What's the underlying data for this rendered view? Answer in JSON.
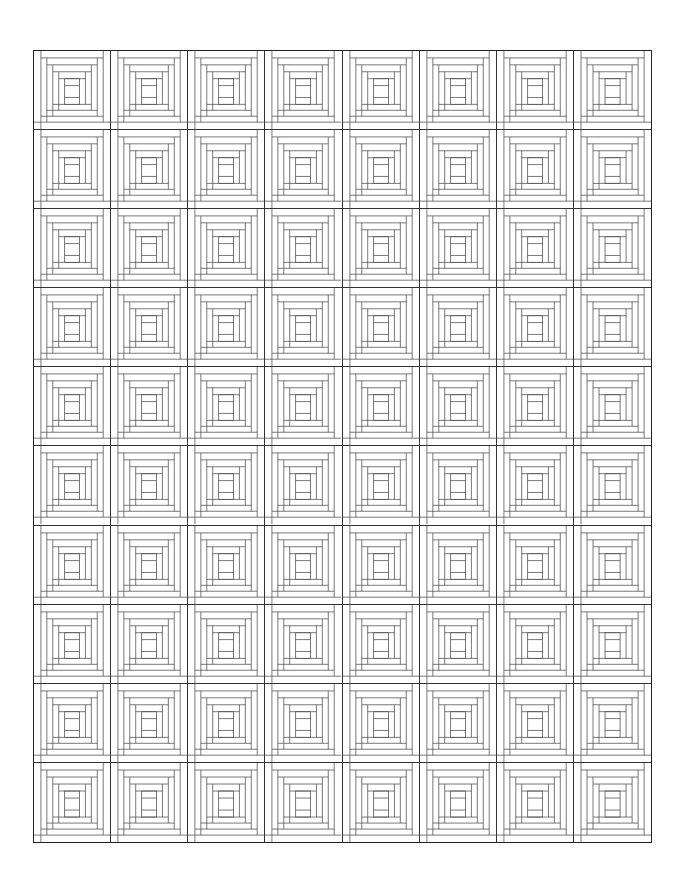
{
  "pattern": {
    "type": "log-cabin-quilt-outline",
    "columns": 8,
    "rows": 10,
    "line_color": "#333333",
    "inner_line_color": "#555555",
    "background": "#ffffff"
  }
}
